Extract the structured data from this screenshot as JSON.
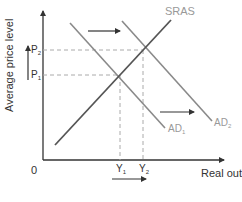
{
  "diagram": {
    "type": "AD-AS shift",
    "axes": {
      "y_label": "Average price level",
      "x_label": "Real output (Y)",
      "origin_label": "0"
    },
    "curves": {
      "sras": {
        "label": "SRAS",
        "color": "#555555"
      },
      "ad1": {
        "label": "AD",
        "sub": "1",
        "color": "#8a8a8a"
      },
      "ad2": {
        "label": "AD",
        "sub": "2",
        "color": "#8a8a8a"
      }
    },
    "prices": {
      "p1": {
        "label": "P",
        "sub": "1"
      },
      "p2": {
        "label": "P",
        "sub": "2"
      }
    },
    "outputs": {
      "y1": {
        "label": "Y",
        "sub": "1"
      },
      "y2": {
        "label": "Y",
        "sub": "2"
      }
    },
    "arrows": [
      "top: AD shift right",
      "middle: AD shift right",
      "left axis: price level rises",
      "below x-axis: output rises"
    ],
    "colors": {
      "axis": "#333333",
      "dashed": "#aaaaaa",
      "label_light": "#999999",
      "label_dark": "#333333"
    }
  }
}
